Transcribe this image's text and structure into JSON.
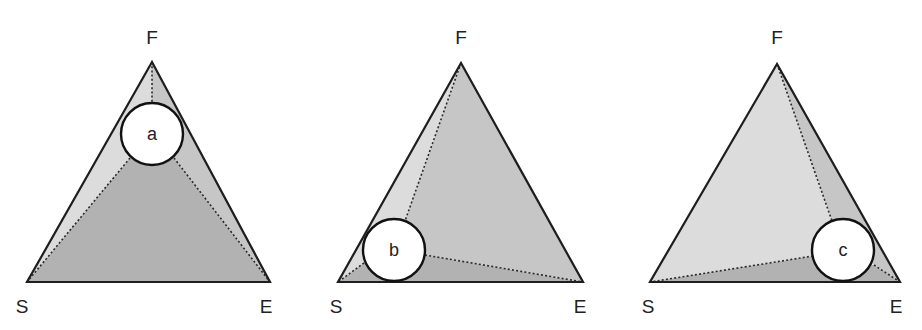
{
  "colors": {
    "light": "#dcdcdc",
    "medium": "#c6c6c6",
    "dark": "#b2b2b2",
    "outline": "#1e1e1e"
  },
  "diagrams": [
    {
      "id": "a",
      "circle_label": "a",
      "vertex_labels": {
        "top": "F",
        "left": "S",
        "right": "E"
      },
      "vertices": {
        "F": [
          152,
          62
        ],
        "S": [
          27,
          282
        ],
        "E": [
          270,
          282
        ]
      },
      "circle": {
        "cx": 152,
        "cy": 134,
        "r": 31
      },
      "label_pos": {
        "F": [
          152,
          44
        ],
        "S": [
          22,
          313
        ],
        "E": [
          266,
          313
        ]
      },
      "regions": [
        {
          "name": "left-region",
          "shade": "light",
          "points": [
            [
              152,
              62
            ],
            [
              27,
              282
            ],
            [
              130,
              158
            ],
            [
              152,
              103
            ]
          ]
        },
        {
          "name": "right-region",
          "shade": "medium",
          "points": [
            [
              152,
              62
            ],
            [
              270,
              282
            ],
            [
              174,
              158
            ],
            [
              152,
              103
            ]
          ]
        },
        {
          "name": "bottom-region",
          "shade": "dark",
          "points": [
            [
              27,
              282
            ],
            [
              270,
              282
            ],
            [
              174,
              158
            ],
            [
              130,
              158
            ]
          ]
        }
      ],
      "dotted_lines": [
        [
          [
            152,
            62
          ],
          [
            152,
            103
          ]
        ],
        [
          [
            130,
            158
          ],
          [
            27,
            282
          ]
        ],
        [
          [
            174,
            158
          ],
          [
            270,
            282
          ]
        ]
      ]
    },
    {
      "id": "b",
      "circle_label": "b",
      "vertex_labels": {
        "top": "F",
        "left": "S",
        "right": "E"
      },
      "vertices": {
        "F": [
          461,
          63
        ],
        "S": [
          338,
          282
        ],
        "E": [
          583,
          282
        ]
      },
      "circle": {
        "cx": 394,
        "cy": 250,
        "r": 31
      },
      "label_pos": {
        "F": [
          461,
          44
        ],
        "S": [
          336,
          313
        ],
        "E": [
          580,
          313
        ]
      },
      "regions": [
        {
          "name": "left-region",
          "shade": "light",
          "points": [
            [
              461,
              63
            ],
            [
              338,
              282
            ],
            [
              364,
              263
            ],
            [
              405,
              221
            ]
          ]
        },
        {
          "name": "right-region",
          "shade": "medium",
          "points": [
            [
              461,
              63
            ],
            [
              583,
              282
            ],
            [
              425,
              255
            ],
            [
              405,
              221
            ]
          ]
        },
        {
          "name": "bottom-region",
          "shade": "dark",
          "points": [
            [
              338,
              282
            ],
            [
              583,
              282
            ],
            [
              425,
              255
            ],
            [
              364,
              263
            ]
          ]
        }
      ],
      "dotted_lines": [
        [
          [
            461,
            63
          ],
          [
            405,
            221
          ]
        ],
        [
          [
            364,
            263
          ],
          [
            338,
            282
          ]
        ],
        [
          [
            425,
            255
          ],
          [
            583,
            282
          ]
        ]
      ]
    },
    {
      "id": "c",
      "circle_label": "c",
      "vertex_labels": {
        "top": "F",
        "left": "S",
        "right": "E"
      },
      "vertices": {
        "F": [
          777,
          64
        ],
        "S": [
          650,
          282
        ],
        "E": [
          900,
          282
        ]
      },
      "circle": {
        "cx": 843,
        "cy": 250,
        "r": 31
      },
      "label_pos": {
        "F": [
          777,
          44
        ],
        "S": [
          648,
          313
        ],
        "E": [
          896,
          313
        ]
      },
      "regions": [
        {
          "name": "left-region",
          "shade": "light",
          "points": [
            [
              777,
              64
            ],
            [
              650,
              282
            ],
            [
              813,
              256
            ],
            [
              832,
              221
            ]
          ]
        },
        {
          "name": "right-region",
          "shade": "medium",
          "points": [
            [
              777,
              64
            ],
            [
              900,
              282
            ],
            [
              874,
              265
            ],
            [
              832,
              221
            ]
          ]
        },
        {
          "name": "bottom-region",
          "shade": "dark",
          "points": [
            [
              650,
              282
            ],
            [
              900,
              282
            ],
            [
              874,
              265
            ],
            [
              813,
              256
            ]
          ]
        }
      ],
      "dotted_lines": [
        [
          [
            777,
            64
          ],
          [
            832,
            221
          ]
        ],
        [
          [
            813,
            256
          ],
          [
            650,
            282
          ]
        ],
        [
          [
            874,
            265
          ],
          [
            900,
            282
          ]
        ]
      ]
    }
  ]
}
